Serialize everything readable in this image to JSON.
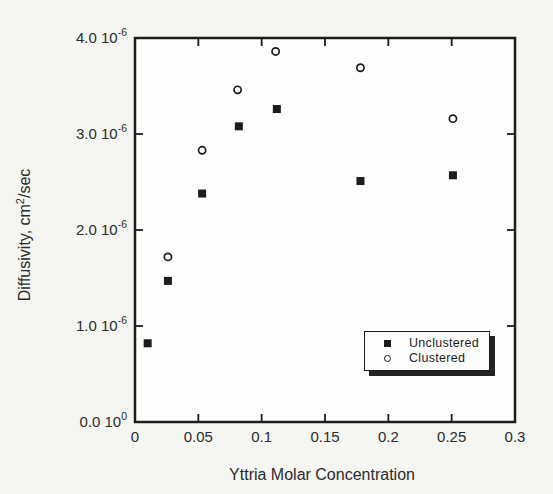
{
  "figure": {
    "width": 553,
    "height": 494,
    "background_color": "#f5f5f2",
    "plot_background_color": "#fdfdfc",
    "line_color": "#1c1c1c",
    "text_color": "#2b2b2b"
  },
  "axis_titles": {
    "y_prefix": "Diffusivity, cm",
    "y_sup": "2",
    "y_suffix": "/sec",
    "x": "Yttria Molar Concentration"
  },
  "legend": {
    "items": [
      {
        "label": "Unclustered",
        "marker": "filled-square-icon"
      },
      {
        "label": "Clustered",
        "marker": "open-circle-icon"
      }
    ]
  },
  "chart_data": {
    "type": "scatter",
    "title": "",
    "xlabel": "Yttria Molar Concentration",
    "ylabel": "Diffusivity, cm^2/sec",
    "xlim": [
      0,
      0.3
    ],
    "ylim": [
      0,
      4e-06
    ],
    "grid": false,
    "legend_position": "lower right",
    "x_ticks": [
      {
        "value": 0.0,
        "label": "0"
      },
      {
        "value": 0.05,
        "label": "0.05"
      },
      {
        "value": 0.1,
        "label": "0.1"
      },
      {
        "value": 0.15,
        "label": "0.15"
      },
      {
        "value": 0.2,
        "label": "0.2"
      },
      {
        "value": 0.25,
        "label": "0.25"
      },
      {
        "value": 0.3,
        "label": "0.3"
      }
    ],
    "y_ticks": [
      {
        "value": 0.0,
        "mantissa": "0.0 10",
        "exponent": "0"
      },
      {
        "value": 1e-06,
        "mantissa": "1.0 10",
        "exponent": "-6"
      },
      {
        "value": 2e-06,
        "mantissa": "2.0 10",
        "exponent": "-6"
      },
      {
        "value": 3e-06,
        "mantissa": "3.0 10",
        "exponent": "-6"
      },
      {
        "value": 4e-06,
        "mantissa": "4.0 10",
        "exponent": "-6"
      }
    ],
    "series": [
      {
        "name": "Unclustered",
        "marker": "filled-square",
        "points": [
          [
            0.01,
            8.2e-07
          ],
          [
            0.026,
            1.47e-06
          ],
          [
            0.053,
            2.38e-06
          ],
          [
            0.082,
            3.08e-06
          ],
          [
            0.112,
            3.26e-06
          ],
          [
            0.178,
            2.51e-06
          ],
          [
            0.251,
            2.57e-06
          ]
        ]
      },
      {
        "name": "Clustered",
        "marker": "open-circle",
        "points": [
          [
            0.026,
            1.72e-06
          ],
          [
            0.053,
            2.83e-06
          ],
          [
            0.081,
            3.46e-06
          ],
          [
            0.111,
            3.86e-06
          ],
          [
            0.178,
            3.69e-06
          ],
          [
            0.251,
            3.16e-06
          ]
        ]
      }
    ]
  },
  "plot_geometry": {
    "left": 135,
    "top": 38,
    "right": 515,
    "bottom": 422,
    "tick_length": 8
  }
}
